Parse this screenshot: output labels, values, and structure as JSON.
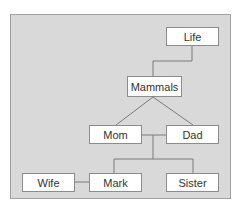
{
  "diagram": {
    "type": "family-tree",
    "colors": {
      "background": "#d9d9d9",
      "node": "#ffffff",
      "line": "#7a7a7a",
      "border": "#8c8c8c"
    },
    "nodes": [
      {
        "id": "life",
        "label": "Life"
      },
      {
        "id": "mammals",
        "label": "Mammals"
      },
      {
        "id": "mom",
        "label": "Mom"
      },
      {
        "id": "dad",
        "label": "Dad"
      },
      {
        "id": "wife",
        "label": "Wife"
      },
      {
        "id": "mark",
        "label": "Mark"
      },
      {
        "id": "sister",
        "label": "Sister"
      }
    ],
    "edges": [
      {
        "from": "life",
        "to": "mammals"
      },
      {
        "from": "mammals",
        "to": "mom"
      },
      {
        "from": "mammals",
        "to": "dad"
      },
      {
        "from": "mom",
        "to": "dad",
        "kind": "marriage"
      },
      {
        "from": "mom+dad",
        "to": "mark"
      },
      {
        "from": "mom+dad",
        "to": "sister"
      },
      {
        "from": "wife",
        "to": "mark",
        "kind": "marriage"
      }
    ]
  }
}
